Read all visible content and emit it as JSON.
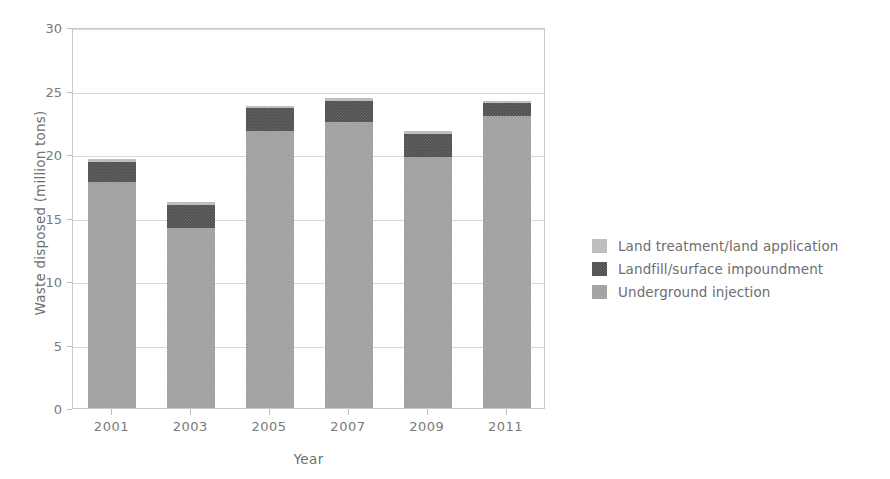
{
  "chart_data": {
    "type": "bar",
    "title": "",
    "subtitle": "",
    "xlabel": "Year",
    "ylabel": "Waste disposed (million tons)",
    "categories": [
      "2001",
      "2003",
      "2005",
      "2007",
      "2009",
      "2011"
    ],
    "ylim": [
      0,
      30
    ],
    "yticks": [
      0,
      5,
      10,
      15,
      20,
      25,
      30
    ],
    "ytick_labels": [
      "0",
      "5",
      "10",
      "15",
      "20",
      "25",
      "30"
    ],
    "grid": true,
    "grid_axis": "y",
    "stacked": true,
    "legend_position": "right",
    "series": [
      {
        "name": "Land treatment/land application",
        "color": "#b9b9b9",
        "values": [
          0.2,
          0.2,
          0.2,
          0.2,
          0.2,
          0.2
        ]
      },
      {
        "name": "Landfill/surface impoundment",
        "color": "#4e4e4e",
        "values": [
          1.6,
          1.8,
          1.8,
          1.7,
          1.8,
          1.0
        ]
      },
      {
        "name": "Underground injection",
        "color": "#9d9d9d",
        "values": [
          17.8,
          14.2,
          21.8,
          22.5,
          19.8,
          23.0
        ]
      }
    ],
    "totals": [
      19.4,
      16.0,
      23.6,
      24.2,
      21.6,
      24.0
    ],
    "annotations": []
  },
  "axes": {
    "y_title": "Waste disposed (million tons)",
    "x_title": "Year",
    "y_tick_labels": [
      "30",
      "25",
      "20",
      "15",
      "10",
      "5",
      "0"
    ],
    "x_tick_labels": [
      "2001",
      "2003",
      "2005",
      "2007",
      "2009",
      "2011"
    ]
  },
  "legend": {
    "items": [
      {
        "label": "Land treatment/land application",
        "swatch": "legend-swatch-land-treatment"
      },
      {
        "label": "Landfill/surface impoundment",
        "swatch": "legend-swatch-landfill"
      },
      {
        "label": "Underground injection",
        "swatch": "legend-swatch-underground-injection"
      }
    ]
  },
  "colors": {
    "underground_injection": "#9d9d9d",
    "landfill_surface_impoundment": "#4e4e4e",
    "land_treatment_land_application": "#b9b9b9",
    "gridline": "#d8d8d8",
    "axis_frame": "#c9c9c9",
    "text": "#6e6e6e",
    "background": "#ffffff"
  }
}
